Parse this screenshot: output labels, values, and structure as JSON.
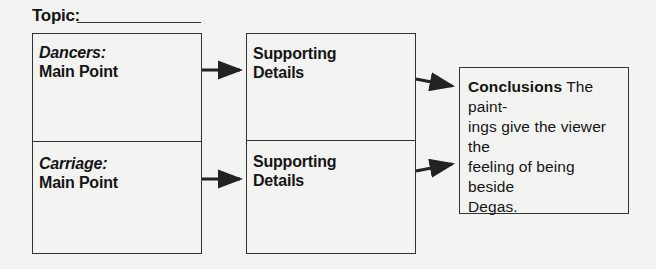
{
  "topic": {
    "label": "Topic:",
    "value": ""
  },
  "main_points": [
    {
      "title": "Dancers:",
      "subtitle": "Main Point"
    },
    {
      "title": "Carriage:",
      "subtitle": "Main Point"
    }
  ],
  "supporting_details": [
    {
      "label_line1": "Supporting",
      "label_line2": "Details"
    },
    {
      "label_line1": "Supporting",
      "label_line2": "Details"
    }
  ],
  "conclusion": {
    "label": "Conclusions",
    "text": "The paintings give the viewer the feeling of being beside Degas.",
    "line1": "The paint-",
    "line2": "ings give the viewer the",
    "line3": "feeling of being beside",
    "line4": "Degas."
  },
  "colors": {
    "background": "#f3f3f2",
    "stroke": "#333333",
    "text": "#151515"
  }
}
